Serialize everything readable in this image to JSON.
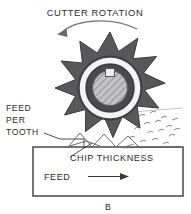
{
  "figure": {
    "panel_label": "B",
    "caption_top": "CUTTER ROTATION",
    "labels": {
      "feed_per_tooth_line1": "FEED",
      "feed_per_tooth_line2": "PER",
      "feed_per_tooth_line3": "TOOTH",
      "chip_thickness": "CHIP THICKNESS",
      "feed": "FEED"
    },
    "icons": {
      "rotation_arrow": "curved-arrow-counterclockwise-icon",
      "feed_arrow": "arrow-right-icon",
      "cutter": "milling-cutter-icon",
      "chips": "metal-chips-icon",
      "keyway": "keyway-square-icon",
      "hatch": "section-hatching-icon"
    },
    "colors": {
      "background": "#ffffff",
      "ink": "#2b2b2b",
      "cutter_body": "#58585a",
      "cutter_outline": "#3a3a3c",
      "hub_ring_dark": "#4a4a4c",
      "hub_ring_light": "#f2f2f2",
      "hub_fill": "#b9b9bb",
      "line": "#3a3a3c"
    },
    "geometry": {
      "cutter_center_x": 110,
      "cutter_center_y": 88,
      "tooth_count": 11,
      "tip_radius": 56,
      "root_radius": 36,
      "outer_ring_radius": 31,
      "white_ring_radius": 27,
      "hub_radius": 20,
      "workpiece_left": 33,
      "workpiece_top": 147,
      "workpiece_right": 183,
      "workpiece_bottom": 196
    }
  }
}
